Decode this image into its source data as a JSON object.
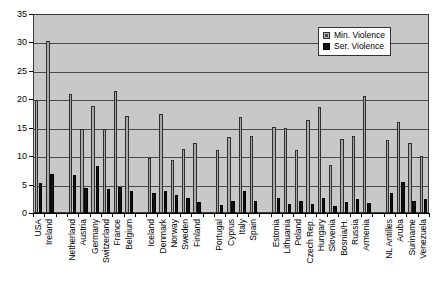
{
  "chart_data": {
    "type": "bar",
    "title": "",
    "subtitle": "",
    "xlabel": "",
    "ylabel": "",
    "ylim": [
      0,
      35
    ],
    "ytick_step": 5,
    "yticks": [
      "0",
      "5",
      "10",
      "15",
      "20",
      "25",
      "30",
      "35"
    ],
    "grid": true,
    "legend_position": "top-right",
    "categories": [
      "USA",
      "Ireland",
      "Netherland",
      "Austria",
      "Germany",
      "Switzerland",
      "France",
      "Belgium",
      "Iceland",
      "Denmark",
      "Norway",
      "Sweden",
      "Finland",
      "Portugal",
      "Cyprus",
      "Italy",
      "Spain",
      "Estonia",
      "Lithuania",
      "Poland",
      "Czech Rep.",
      "Hungary",
      "Slovenia",
      "Bosnia/H.",
      "Russia",
      "Armenia",
      "NL Antilles",
      "Aruba",
      "Suriname",
      "Venezuela"
    ],
    "group_breaks": [
      2,
      8,
      13,
      17,
      26
    ],
    "series": [
      {
        "name": "Min. Violence",
        "color": "#a8a8a8",
        "values": [
          19.9,
          30.3,
          21.0,
          14.7,
          18.9,
          14.7,
          21.5,
          17.1,
          9.7,
          17.4,
          9.4,
          11.2,
          12.3,
          11.0,
          13.3,
          16.9,
          13.6,
          15.2,
          15.0,
          11.0,
          16.4,
          18.7,
          8.5,
          13.1,
          13.5,
          20.5,
          12.8,
          16.0,
          12.3,
          10.0
        ]
      },
      {
        "name": "Ser. Violence",
        "color": "#121212",
        "values": [
          5.3,
          6.8,
          6.6,
          4.4,
          8.3,
          4.3,
          4.6,
          3.9,
          3.5,
          3.9,
          3.1,
          2.6,
          1.9,
          1.4,
          2.1,
          3.8,
          2.1,
          2.7,
          1.5,
          2.1,
          1.6,
          2.6,
          1.2,
          1.9,
          2.5,
          1.7,
          3.6,
          5.4,
          2.2,
          2.4
        ]
      }
    ]
  },
  "legend": {
    "items": [
      {
        "label": "Min. Violence",
        "key": "min"
      },
      {
        "label": "Ser. Violence",
        "key": "ser"
      }
    ]
  }
}
